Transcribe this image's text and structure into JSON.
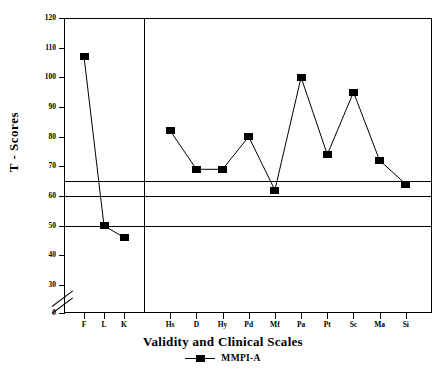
{
  "chart_data": {
    "type": "line",
    "title": "",
    "xlabel": "Validity and Clinical Scales",
    "ylabel": "T - Scores",
    "categories": [
      "F",
      "L",
      "K",
      "Hs",
      "D",
      "Hy",
      "Pd",
      "Mf",
      "Pa",
      "Pt",
      "Sc",
      "Ma",
      "Si"
    ],
    "series": [
      {
        "name": "MMPI-A",
        "values": [
          107,
          50,
          46,
          82,
          69,
          69,
          80,
          62,
          100,
          74,
          95,
          72,
          64
        ]
      }
    ],
    "segments": [
      {
        "name": "validity",
        "categories": [
          "F",
          "L",
          "K"
        ]
      },
      {
        "name": "clinical",
        "categories": [
          "Hs",
          "D",
          "Hy",
          "Pd",
          "Mf",
          "Pa",
          "Pt",
          "Sc",
          "Ma",
          "Si"
        ]
      }
    ],
    "ylim": [
      0,
      120
    ],
    "ytick_labels": [
      "0",
      "30",
      "40",
      "50",
      "60",
      "70",
      "80",
      "90",
      "100",
      "110",
      "120"
    ],
    "ytick_values": [
      0,
      30,
      40,
      50,
      60,
      70,
      80,
      90,
      100,
      110,
      120
    ],
    "y_axis_break_between": [
      0,
      30
    ],
    "reference_lines": [
      65,
      60,
      50
    ],
    "grid": false,
    "legend_position": "bottom",
    "legend_entries": [
      "MMPI-A"
    ],
    "marker": "square",
    "series_color": "#000000"
  }
}
